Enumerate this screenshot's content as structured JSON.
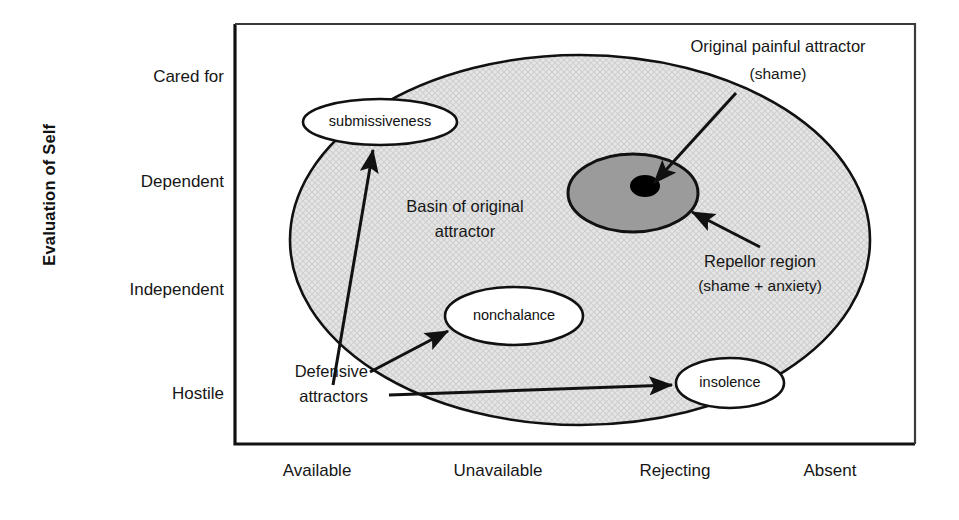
{
  "figure": {
    "axis_y_title": "Evaluation of Self",
    "y_ticks": [
      {
        "label": "Cared for",
        "y": 78
      },
      {
        "label": "Dependent",
        "y": 183
      },
      {
        "label": "Independent",
        "y": 291
      },
      {
        "label": "Hostile",
        "y": 395
      }
    ],
    "x_ticks": [
      {
        "label": "Available",
        "x": 317
      },
      {
        "label": "Unavailable",
        "x": 498
      },
      {
        "label": "Rejecting",
        "x": 675
      },
      {
        "label": "Absent",
        "x": 830
      }
    ],
    "plot_frame": {
      "left": 235,
      "top": 24,
      "right": 915,
      "bottom": 444
    },
    "basin": {
      "label_line1": "Basin of original",
      "label_line2": "attractor",
      "fill_color": "#e2e2e2",
      "stroke_color": "#111111"
    },
    "repellor": {
      "label_line1": "Repellor region",
      "label_line2": "(shame + anxiety)",
      "fill_color": "#9b9b9b",
      "stroke_color": "#111111"
    },
    "original_attractor": {
      "label_line1": "Original painful attractor",
      "label_line2": "(shame)",
      "fill_color": "#000000"
    },
    "defensive": {
      "label_line1": "Defensive",
      "label_line2": "attractors"
    },
    "attractor_ellipses": [
      {
        "name": "submissiveness",
        "label": "submissiveness",
        "cx": 380,
        "cy": 122,
        "rx": 77,
        "ry": 23
      },
      {
        "name": "nonchalance",
        "label": "nonchalance",
        "cx": 514,
        "cy": 316,
        "rx": 69,
        "ry": 29
      },
      {
        "name": "insolence",
        "label": "insolence",
        "cx": 730,
        "cy": 383,
        "rx": 54,
        "ry": 25
      }
    ]
  }
}
